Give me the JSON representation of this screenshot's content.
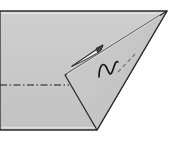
{
  "canvas": {
    "width": 173,
    "height": 143,
    "background_color": "#ffffff",
    "title": "Origami fold step diagram"
  },
  "palette": {
    "paper_fill": "#c6c6c6",
    "flap_fill": "#c6c6c6",
    "outline_stroke": "#2b2b2b",
    "fold_line_stroke": "#1a1a1a",
    "hidden_edge_stroke": "#6e6e6e",
    "symbol_stroke": "#111111",
    "arrow_fill": "#f2f2f2",
    "arrow_stroke": "#1a1a1a",
    "highlight_edge": "#e8e8e8"
  },
  "figure": {
    "type": "paper-folding-instruction",
    "shapes": [
      {
        "name": "base-sheet",
        "label": "Folded paper base (trapezoid)",
        "points": "0,11 167,11 97,130 0,130",
        "fill": "#c6c6c6",
        "stroke": "#2b2b2b",
        "stroke_width": 1.3
      },
      {
        "name": "triangular-flap",
        "label": "Triangular folded flap",
        "points": "65,75 167,11 97,130",
        "fill": "#c6c6c6",
        "stroke": "#2b2b2b",
        "stroke_width": 1.3
      }
    ],
    "lines": [
      {
        "name": "horizontal-fold-line",
        "label": "Valley fold line (dash-dot)",
        "x1": 0,
        "y1": 85,
        "x2": 69,
        "y2": 85,
        "stroke": "#1a1a1a",
        "stroke_width": 1.1,
        "dash": "7 2.5 1.5 2.5"
      },
      {
        "name": "hidden-edge-dashed",
        "label": "Hidden edge behind flap (dashed)",
        "x1": 118,
        "y1": 72,
        "x2": 136,
        "y2": 53,
        "stroke": "#6e6e6e",
        "stroke_width": 1.1,
        "dash": "4 3"
      }
    ],
    "symbols": [
      {
        "name": "push-arrow",
        "label": "Push / fold-in arrow pointing up-right",
        "tip": [
          102,
          46
        ],
        "tail": [
          72,
          66
        ],
        "fill": "#f2f2f2",
        "stroke": "#1a1a1a"
      },
      {
        "name": "pleat-squiggle",
        "label": "Pleat / crimp squiggle symbol",
        "path": "M 99,77 C 99,66 103,62 106,67 C 109,72 110,77 112,73 C 114,68 115,60 118,62",
        "stroke": "#111111",
        "stroke_width": 1.6
      }
    ]
  },
  "annotations": {
    "step_number": "",
    "caption": ""
  }
}
